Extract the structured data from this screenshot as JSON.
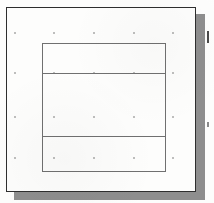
{
  "figure": {
    "kind": "scanned-technical-drawing",
    "caption": "",
    "background_color": "#fdfdfc",
    "line_color": "#707070",
    "frame_color": "#2e2e2e",
    "shadow_color": "#8e8e8e",
    "dot_color": "#a9a9a9"
  },
  "sheet": {
    "label": "drawing sheet",
    "x": 6,
    "y": 7,
    "width": 190,
    "height": 185
  },
  "inner_rectangle": {
    "label": "inner rectangle",
    "x": 42,
    "y": 43,
    "width": 124,
    "height": 129
  },
  "dividers": [
    {
      "label": "upper division line",
      "y": 73
    },
    {
      "label": "lower division line",
      "y": 136
    }
  ],
  "bands": [
    {
      "label": "upper band",
      "top": 43,
      "bottom": 73
    },
    {
      "label": "middle band",
      "top": 73,
      "bottom": 136
    },
    {
      "label": "lower band",
      "top": 136,
      "bottom": 172
    }
  ],
  "dot_grid": {
    "label": "registration dot grid",
    "columns": [
      15,
      54,
      94,
      134,
      173
    ],
    "rows": [
      33,
      73,
      117,
      158
    ]
  },
  "edge_marks": [
    {
      "label": "upper edge mark",
      "x": 207,
      "y": 31
    },
    {
      "label": "lower edge mark",
      "x": 207,
      "y": 122
    }
  ]
}
